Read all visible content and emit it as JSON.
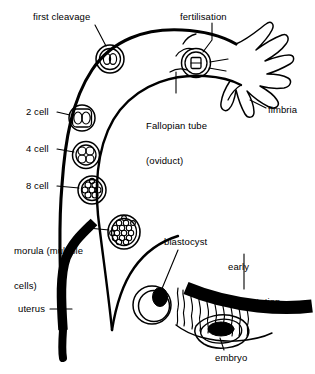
{
  "diagram": {
    "type": "biological-process-diagram",
    "background_color": "#ffffff",
    "line_color": "#000000",
    "labels": {
      "first_cleavage": "first cleavage",
      "fertilisation": "fertilisation",
      "fallopian_tube_line1": "Fallopian tube",
      "fallopian_tube_line2": "(oviduct)",
      "fimbria": "fimbria",
      "two_cell": "2 cell",
      "four_cell": "4 cell",
      "eight_cell": "8 cell",
      "morula_line1": "morula (multiple",
      "morula_line2": "cells)",
      "uterus": "uterus",
      "blastocyst": "blastocyst",
      "early_implantation_line1": "early",
      "early_implantation_line2": "implantation",
      "embryo": "embryo"
    },
    "stages": [
      {
        "name": "fertilisation",
        "cell_count": 1,
        "description": "ovum with sperm penetrating"
      },
      {
        "name": "first cleavage",
        "cell_count": 1,
        "description": "zygote dividing"
      },
      {
        "name": "2 cell",
        "cell_count": 2,
        "description": "two blastomeres"
      },
      {
        "name": "4 cell",
        "cell_count": 4,
        "description": "four blastomeres"
      },
      {
        "name": "8 cell",
        "cell_count": 8,
        "description": "eight blastomeres"
      },
      {
        "name": "morula (multiple cells)",
        "cell_count": 16,
        "description": "solid ball of cells"
      },
      {
        "name": "blastocyst",
        "cell_count": 1,
        "description": "hollow sphere with inner cell mass"
      },
      {
        "name": "early implantation",
        "cell_count": 1,
        "description": "embryo embedded in endometrium"
      }
    ],
    "anatomy": [
      {
        "name": "Fallopian tube (oviduct)",
        "kind": "duct"
      },
      {
        "name": "fimbria",
        "kind": "finger-like projections"
      },
      {
        "name": "uterus",
        "kind": "muscular wall"
      },
      {
        "name": "embryo",
        "kind": "implanted conceptus"
      }
    ]
  }
}
